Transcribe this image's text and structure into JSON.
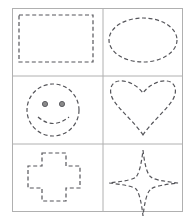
{
  "worksheet": {
    "title": "Shape Tracing Worksheet",
    "background_color": "#ffffff",
    "grid": {
      "border_color": "#b0b0b0",
      "border_width": 1,
      "columns": 2,
      "rows": 3,
      "x": 12,
      "y": 8,
      "width": 171,
      "height": 204,
      "column_divider_x": 103,
      "row_divider_y": [
        76,
        144
      ]
    },
    "stroke": {
      "color": "#55555a",
      "width": 1.2,
      "dash_pattern": "4 2.6"
    },
    "cells": [
      {
        "index": 0,
        "name": "rectangle",
        "label": "Rectangle",
        "row": 0,
        "column": 0
      },
      {
        "index": 1,
        "name": "ellipse",
        "label": "Ellipse",
        "row": 0,
        "column": 1
      },
      {
        "index": 2,
        "name": "smiley-face",
        "label": "Smiley Face",
        "row": 1,
        "column": 0,
        "eye_color": "#8a8a8a",
        "eye_outline_color": "#55555a"
      },
      {
        "index": 3,
        "name": "heart",
        "label": "Heart",
        "row": 1,
        "column": 1
      },
      {
        "index": 4,
        "name": "cross",
        "label": "Cross",
        "row": 2,
        "column": 0
      },
      {
        "index": 5,
        "name": "four-pointed-star",
        "label": "Four Pointed Star",
        "row": 2,
        "column": 1
      }
    ]
  }
}
